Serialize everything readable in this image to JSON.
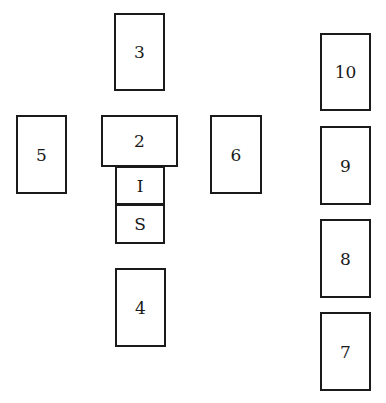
{
  "diagram": {
    "cards": [
      {
        "id": "3",
        "label": "3",
        "x": 114,
        "y": 13,
        "w": 51,
        "h": 78
      },
      {
        "id": "5",
        "label": "5",
        "x": 16,
        "y": 115,
        "w": 51,
        "h": 79
      },
      {
        "id": "2",
        "label": "2",
        "x": 101,
        "y": 115,
        "w": 77,
        "h": 52
      },
      {
        "id": "6",
        "label": "6",
        "x": 210,
        "y": 115,
        "w": 52,
        "h": 79
      },
      {
        "id": "1",
        "label": "I",
        "x": 115,
        "y": 166,
        "w": 50,
        "h": 39
      },
      {
        "id": "S",
        "label": "S",
        "x": 115,
        "y": 204,
        "w": 50,
        "h": 40
      },
      {
        "id": "4",
        "label": "4",
        "x": 115,
        "y": 268,
        "w": 51,
        "h": 79
      },
      {
        "id": "10",
        "label": "10",
        "x": 320,
        "y": 33,
        "w": 51,
        "h": 78
      },
      {
        "id": "9",
        "label": "9",
        "x": 320,
        "y": 126,
        "w": 51,
        "h": 79
      },
      {
        "id": "8",
        "label": "8",
        "x": 320,
        "y": 219,
        "w": 51,
        "h": 79
      },
      {
        "id": "7",
        "label": "7",
        "x": 320,
        "y": 312,
        "w": 51,
        "h": 79
      }
    ]
  }
}
